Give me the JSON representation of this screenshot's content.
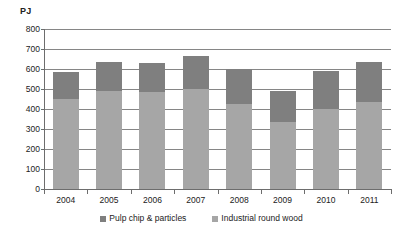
{
  "chart_data": {
    "type": "bar",
    "subtype": "stacked-column",
    "title": "",
    "subtitle": "",
    "xlabel": "",
    "ylabel": "PJ",
    "unit_label": "PJ",
    "ylim": [
      0,
      800
    ],
    "ytick_step": 100,
    "yticks": [
      800,
      700,
      600,
      500,
      400,
      300,
      200,
      100,
      0
    ],
    "ytick_labels": [
      "800",
      "700",
      "600",
      "500",
      "400",
      "300",
      "200",
      "100",
      "0"
    ],
    "grid": true,
    "grid_axis": "y",
    "legend_position": "bottom",
    "categories": [
      "2004",
      "2005",
      "2006",
      "2007",
      "2008",
      "2009",
      "2010",
      "2011"
    ],
    "series": [
      {
        "name": "Industrial round wood",
        "color": "#a6a6a6",
        "stack_order": 0,
        "values": [
          450,
          490,
          485,
          500,
          425,
          335,
          398,
          437
        ]
      },
      {
        "name": "Pulp chip & particles",
        "color": "#7f7f7f",
        "stack_order": 1,
        "values": [
          135,
          145,
          147,
          167,
          175,
          153,
          192,
          200
        ]
      }
    ],
    "totals": [
      585,
      635,
      632,
      667,
      600,
      488,
      590,
      637
    ]
  },
  "legend": {
    "items": [
      {
        "label": "Pulp chip & particles",
        "color": "#7f7f7f"
      },
      {
        "label": "Industrial round wood",
        "color": "#a6a6a6"
      }
    ]
  },
  "colors": {
    "pulp_chip": "#7f7f7f",
    "round_wood": "#a6a6a6",
    "gridline": "#868686",
    "axis": "#6d6d6d",
    "text": "#222222",
    "background": "#ffffff"
  }
}
